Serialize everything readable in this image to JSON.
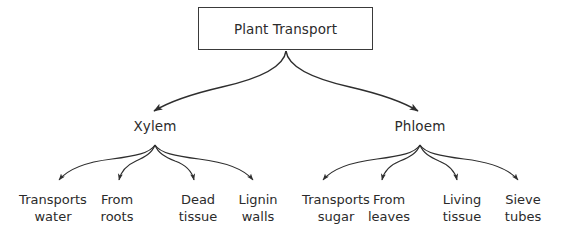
{
  "diagram": {
    "type": "hierarchy-tree",
    "background_color": "#ffffff",
    "stroke_color": "#333333",
    "text_color": "#2b2b2b",
    "root": {
      "label": "Plant Transport"
    },
    "branches": [
      {
        "label": "Xylem",
        "children": [
          {
            "line1": "Transports",
            "line2": "water"
          },
          {
            "line1": "From",
            "line2": "roots"
          },
          {
            "line1": "Dead",
            "line2": "tissue"
          },
          {
            "line1": "Lignin",
            "line2": "walls"
          }
        ]
      },
      {
        "label": "Phloem",
        "children": [
          {
            "line1": "Transports",
            "line2": "sugar"
          },
          {
            "line1": "From",
            "line2": "leaves"
          },
          {
            "line1": "Living",
            "line2": "tissue"
          },
          {
            "line1": "Sieve",
            "line2": "tubes"
          }
        ]
      }
    ]
  }
}
